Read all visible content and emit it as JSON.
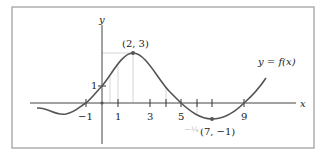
{
  "diagram": {
    "axes": {
      "x_label": "x",
      "y_label": "y"
    },
    "x_tick_labels": [
      "−1",
      "1",
      "3",
      "5",
      "9"
    ],
    "x_ticks": [
      -1,
      0,
      1,
      3,
      4,
      5,
      6,
      7,
      9
    ],
    "y_tick_labels": [
      "1"
    ],
    "curve_label": "y = f(x)",
    "points": [
      {
        "label": "(2, 3)",
        "x": 2,
        "y": 3
      },
      {
        "label": "(7, −1)",
        "x": 7,
        "y": -1
      }
    ],
    "x_intercepts": [
      -1,
      5,
      9
    ],
    "y_intercept": 1,
    "colors": {
      "curve": "#555555",
      "axis": "#444444",
      "frame": "#9a9a9a",
      "background": "#ffffff"
    }
  }
}
